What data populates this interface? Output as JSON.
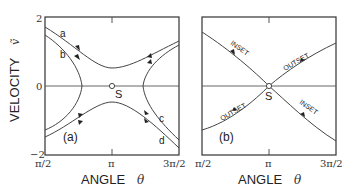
{
  "figure": {
    "y_axis_label": "VELOCITY",
    "y_axis_symbol": "ṽ",
    "y_ticks": [
      "2",
      "0",
      "−2"
    ],
    "panels": [
      {
        "id": "a",
        "tag": "(a)",
        "x_axis_label": "ANGLE",
        "x_axis_symbol": "θ",
        "x_ticks": [
          "π/2",
          "π",
          "3π/2"
        ],
        "saddle_label": "S",
        "curve_labels": [
          "a",
          "b",
          "c",
          "d"
        ]
      },
      {
        "id": "b",
        "tag": "(b)",
        "x_axis_label": "ANGLE",
        "x_axis_symbol": "θ",
        "x_ticks": [
          "π/2",
          "π",
          "3π/2"
        ],
        "saddle_label": "S",
        "manifold_labels": {
          "inset_upper": "INSET",
          "outset_upper": "OUTSET",
          "outset_lower": "OUTSET",
          "inset_lower": "INSET"
        }
      }
    ]
  }
}
